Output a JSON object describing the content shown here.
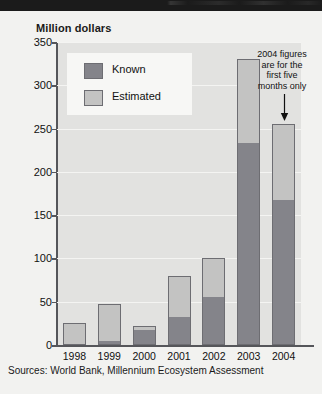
{
  "figure": {
    "title": "Million dollars",
    "source_note": "Sources: World Bank, Millennium Ecosystem Assessment",
    "annotation": {
      "line1": "2004 figures",
      "line2": "are for the",
      "line3": "first five",
      "line4": "months only",
      "arrow_icon": "down-arrow-icon",
      "points_to": "2004"
    },
    "colors": {
      "known": "#84848a",
      "estimated": "#c3c3c2",
      "plot_background": "#e2e2e0",
      "page_background": "#f2f2f0",
      "axis": "#55565a",
      "gridline": "#f4f4f2",
      "text": "#111111"
    }
  },
  "legend": {
    "position": "top-left-inside",
    "entries": [
      {
        "label": "Known",
        "color": "#84848a",
        "swatch_icon": "legend-swatch-known"
      },
      {
        "label": "Estimated",
        "color": "#c3c3c2",
        "swatch_icon": "legend-swatch-estimated"
      }
    ]
  },
  "chart_data": {
    "type": "bar",
    "stacked": true,
    "title": "Million dollars",
    "xlabel": "",
    "ylabel": "Million dollars",
    "ylim": [
      0,
      350
    ],
    "yticks": [
      0,
      50,
      100,
      150,
      200,
      250,
      300,
      350
    ],
    "ytick_labels": [
      "0",
      "50",
      "100",
      "150",
      "200",
      "250",
      "300",
      "350"
    ],
    "grid": true,
    "legend_position": "upper left",
    "categories": [
      "1998",
      "1999",
      "2000",
      "2001",
      "2002",
      "2003",
      "2004"
    ],
    "series": [
      {
        "name": "Known",
        "color": "#84848a",
        "values": [
          0,
          5,
          17,
          32,
          56,
          233,
          168
        ]
      },
      {
        "name": "Estimated",
        "color": "#c3c3c2",
        "values": [
          25,
          42,
          5,
          48,
          44,
          97,
          87
        ]
      }
    ],
    "totals": [
      25,
      47,
      22,
      80,
      100,
      330,
      255
    ],
    "annotations": [
      {
        "text": "2004 figures are for the first five months only",
        "target": "2004"
      }
    ],
    "source": "Sources: World Bank, Millennium Ecosystem Assessment"
  }
}
